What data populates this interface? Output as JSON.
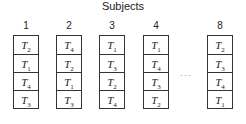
{
  "title": "Subjects",
  "ellipsis": "···",
  "columns": [
    {
      "label": "1",
      "cells": [
        {
          "t": "T",
          "s": "2"
        },
        {
          "t": "T",
          "s": "1"
        },
        {
          "t": "T",
          "s": "4"
        },
        {
          "t": "T",
          "s": "3"
        }
      ]
    },
    {
      "label": "2",
      "cells": [
        {
          "t": "T",
          "s": "4"
        },
        {
          "t": "T",
          "s": "2"
        },
        {
          "t": "T",
          "s": "1"
        },
        {
          "t": "T",
          "s": "3"
        }
      ]
    },
    {
      "label": "3",
      "cells": [
        {
          "t": "T",
          "s": "1"
        },
        {
          "t": "T",
          "s": "3"
        },
        {
          "t": "T",
          "s": "2"
        },
        {
          "t": "T",
          "s": "4"
        }
      ]
    },
    {
      "label": "4",
      "cells": [
        {
          "t": "T",
          "s": "1"
        },
        {
          "t": "T",
          "s": "4"
        },
        {
          "t": "T",
          "s": "3"
        },
        {
          "t": "T",
          "s": "2"
        }
      ]
    },
    {
      "label": "8",
      "cells": [
        {
          "t": "T",
          "s": "2"
        },
        {
          "t": "T",
          "s": "3"
        },
        {
          "t": "T",
          "s": "4"
        },
        {
          "t": "T",
          "s": "1"
        }
      ]
    }
  ]
}
